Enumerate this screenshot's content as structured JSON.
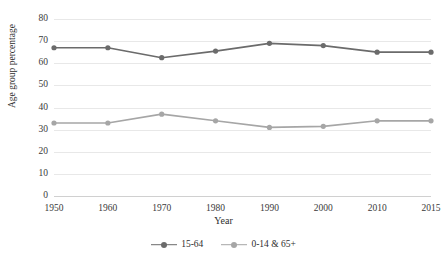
{
  "chart_data": {
    "type": "line",
    "title": "",
    "subtitle": "",
    "xlabel": "Year",
    "ylabel": "Age group percentage",
    "categories": [
      "1950",
      "1960",
      "1970",
      "1980",
      "1990",
      "2000",
      "2010",
      "2015"
    ],
    "ylim": [
      0,
      80
    ],
    "ytick_step": 10,
    "yticks": [
      "80",
      "70",
      "60",
      "50",
      "40",
      "30",
      "20",
      "10",
      "0"
    ],
    "grid": "horizontal",
    "legend_position": "bottom-center",
    "series": [
      {
        "name": "15-64",
        "color": "#6b6b6b",
        "marker": "circle",
        "values": [
          67,
          67,
          62.5,
          65.5,
          69,
          68,
          65,
          65
        ]
      },
      {
        "name": "0-14 & 65+",
        "color": "#a6a6a6",
        "marker": "circle",
        "values": [
          33,
          33,
          37,
          34,
          31,
          31.5,
          34,
          34
        ]
      }
    ]
  },
  "legend": {
    "entries": [
      {
        "label": "15-64"
      },
      {
        "label": "0-14 & 65+"
      }
    ]
  },
  "colors": {
    "series_1": "#6b6b6b",
    "series_2": "#a6a6a6",
    "gridline": "#e8e8e8",
    "text": "#2e2e2e",
    "background": "#ffffff"
  }
}
